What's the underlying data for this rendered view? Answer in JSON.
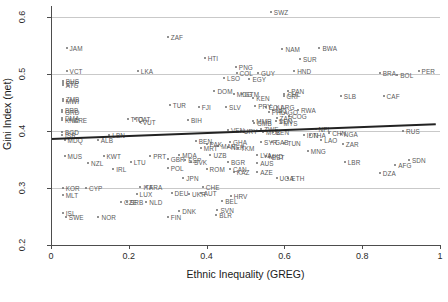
{
  "chart_data": {
    "type": "scatter",
    "title": "",
    "xlabel": "Ethnic Inequality (GREG)",
    "ylabel": "Gini Index (net)",
    "xlim": [
      0,
      1
    ],
    "ylim": [
      0.2,
      0.62
    ],
    "xticks": [
      0,
      0.2,
      0.4,
      0.6,
      0.8,
      1
    ],
    "xticklabels": [
      "0",
      "0.2",
      "0.4",
      "0.6",
      "0.8",
      "1"
    ],
    "yticks": [
      0.2,
      0.3,
      0.4,
      0.5,
      0.6
    ],
    "yticklabels": [
      "0.2",
      "0.3",
      "0.4",
      "0.5",
      "0.6"
    ],
    "grid": "horizontal",
    "legend": "none",
    "point_color": "#6e6e6e",
    "label_color": "#5a5a5a",
    "grid_color": "#c9c9c9",
    "trendline": {
      "type": "linear-fit",
      "color": "#222222",
      "x0": 0.0,
      "y0": 0.388,
      "x1": 0.99,
      "y1": 0.414
    },
    "points": [
      {
        "label": "SWZ",
        "x": 0.565,
        "y": 0.61
      },
      {
        "label": "ZAF",
        "x": 0.3,
        "y": 0.566
      },
      {
        "label": "JAM",
        "x": 0.04,
        "y": 0.547
      },
      {
        "label": "NAM",
        "x": 0.595,
        "y": 0.545
      },
      {
        "label": "BWA",
        "x": 0.69,
        "y": 0.546
      },
      {
        "label": "HTI",
        "x": 0.395,
        "y": 0.528
      },
      {
        "label": "SUR",
        "x": 0.64,
        "y": 0.527
      },
      {
        "label": "VCT",
        "x": 0.04,
        "y": 0.506
      },
      {
        "label": "LKA",
        "x": 0.223,
        "y": 0.505
      },
      {
        "label": "PNG",
        "x": 0.475,
        "y": 0.513
      },
      {
        "label": "COL",
        "x": 0.477,
        "y": 0.503
      },
      {
        "label": "GUY",
        "x": 0.532,
        "y": 0.503
      },
      {
        "label": "HND",
        "x": 0.625,
        "y": 0.505
      },
      {
        "label": "BRA",
        "x": 0.845,
        "y": 0.503
      },
      {
        "label": "PER",
        "x": 0.945,
        "y": 0.505
      },
      {
        "label": "BOL",
        "x": 0.89,
        "y": 0.499
      },
      {
        "label": "LSO",
        "x": 0.445,
        "y": 0.494
      },
      {
        "label": "EGY",
        "x": 0.51,
        "y": 0.492
      },
      {
        "label": "BHS",
        "x": 0.03,
        "y": 0.489
      },
      {
        "label": "CYP",
        "x": 0.03,
        "y": 0.485
      },
      {
        "label": "ATG",
        "x": 0.03,
        "y": 0.481
      },
      {
        "label": "DOM",
        "x": 0.42,
        "y": 0.47
      },
      {
        "label": "MDG",
        "x": 0.47,
        "y": 0.466
      },
      {
        "label": "GTM",
        "x": 0.49,
        "y": 0.466
      },
      {
        "label": "PAN",
        "x": 0.61,
        "y": 0.47
      },
      {
        "label": "CHL",
        "x": 0.6,
        "y": 0.465
      },
      {
        "label": "CRI",
        "x": 0.598,
        "y": 0.462
      },
      {
        "label": "CAF",
        "x": 0.855,
        "y": 0.462
      },
      {
        "label": "SLB",
        "x": 0.745,
        "y": 0.462
      },
      {
        "label": "KEN",
        "x": 0.52,
        "y": 0.458
      },
      {
        "label": "ZMB",
        "x": 0.03,
        "y": 0.456
      },
      {
        "label": "MWI",
        "x": 0.03,
        "y": 0.453
      },
      {
        "label": "FJI",
        "x": 0.38,
        "y": 0.443
      },
      {
        "label": "TUR",
        "x": 0.305,
        "y": 0.446
      },
      {
        "label": "SLV",
        "x": 0.45,
        "y": 0.442
      },
      {
        "label": "PRY",
        "x": 0.525,
        "y": 0.445
      },
      {
        "label": "ECU",
        "x": 0.552,
        "y": 0.443
      },
      {
        "label": "ARG",
        "x": 0.582,
        "y": 0.443
      },
      {
        "label": "NIC",
        "x": 0.57,
        "y": 0.438
      },
      {
        "label": "RWA",
        "x": 0.635,
        "y": 0.437
      },
      {
        "label": "PHL",
        "x": 0.56,
        "y": 0.434
      },
      {
        "label": "AGO",
        "x": 0.59,
        "y": 0.433
      },
      {
        "label": "BRB",
        "x": 0.028,
        "y": 0.438
      },
      {
        "label": "GRD",
        "x": 0.028,
        "y": 0.433
      },
      {
        "label": "DMA",
        "x": 0.028,
        "y": 0.424
      },
      {
        "label": "KNA",
        "x": 0.028,
        "y": 0.42
      },
      {
        "label": "CRE",
        "x": 0.05,
        "y": 0.42
      },
      {
        "label": "TTO",
        "x": 0.197,
        "y": 0.421
      },
      {
        "label": "QAT",
        "x": 0.215,
        "y": 0.421
      },
      {
        "label": "VUT",
        "x": 0.228,
        "y": 0.416
      },
      {
        "label": "BIH",
        "x": 0.352,
        "y": 0.419
      },
      {
        "label": "COG",
        "x": 0.612,
        "y": 0.427
      },
      {
        "label": "ZAR",
        "x": 0.58,
        "y": 0.423
      },
      {
        "label": "SEN",
        "x": 0.578,
        "y": 0.418
      },
      {
        "label": "GMB",
        "x": 0.522,
        "y": 0.414
      },
      {
        "label": "MMR",
        "x": 0.52,
        "y": 0.418
      },
      {
        "label": "VEN",
        "x": 0.455,
        "y": 0.402
      },
      {
        "label": "URY",
        "x": 0.488,
        "y": 0.4
      },
      {
        "label": "MYS",
        "x": 0.59,
        "y": 0.415
      },
      {
        "label": "ZWE",
        "x": 0.54,
        "y": 0.404
      },
      {
        "label": "MOZ",
        "x": 0.545,
        "y": 0.399
      },
      {
        "label": "BEN",
        "x": 0.57,
        "y": 0.398
      },
      {
        "label": "NPL",
        "x": 0.68,
        "y": 0.404
      },
      {
        "label": "NGA",
        "x": 0.745,
        "y": 0.395
      },
      {
        "label": "CHN",
        "x": 0.715,
        "y": 0.397
      },
      {
        "label": "IDN",
        "x": 0.65,
        "y": 0.393
      },
      {
        "label": "THA",
        "x": 0.665,
        "y": 0.393
      },
      {
        "label": "RUS",
        "x": 0.905,
        "y": 0.4
      },
      {
        "label": "BGD",
        "x": 0.028,
        "y": 0.398
      },
      {
        "label": "ISR",
        "x": 0.028,
        "y": 0.394
      },
      {
        "label": "MDQ",
        "x": 0.035,
        "y": 0.385
      },
      {
        "label": "LBN",
        "x": 0.15,
        "y": 0.393
      },
      {
        "label": "ALB",
        "x": 0.12,
        "y": 0.385
      },
      {
        "label": "GHA",
        "x": 0.46,
        "y": 0.381
      },
      {
        "label": "BEN2",
        "x": 0.372,
        "y": 0.383
      },
      {
        "label": "SYR",
        "x": 0.54,
        "y": 0.381
      },
      {
        "label": "GAB",
        "x": 0.568,
        "y": 0.381
      },
      {
        "label": "TUN",
        "x": 0.6,
        "y": 0.379
      },
      {
        "label": "LAO",
        "x": 0.695,
        "y": 0.384
      },
      {
        "label": "ZAR2",
        "x": 0.75,
        "y": 0.378
      },
      {
        "label": "MAR",
        "x": 0.43,
        "y": 0.374
      },
      {
        "label": "PAK",
        "x": 0.4,
        "y": 0.377
      },
      {
        "label": "MRT",
        "x": 0.385,
        "y": 0.37
      },
      {
        "label": "NER",
        "x": 0.455,
        "y": 0.372
      },
      {
        "label": "TKM",
        "x": 0.48,
        "y": 0.37
      },
      {
        "label": "MNG",
        "x": 0.66,
        "y": 0.366
      },
      {
        "label": "MDA",
        "x": 0.33,
        "y": 0.358
      },
      {
        "label": "UZB",
        "x": 0.41,
        "y": 0.358
      },
      {
        "label": "LVA",
        "x": 0.53,
        "y": 0.358
      },
      {
        "label": "EST",
        "x": 0.56,
        "y": 0.355
      },
      {
        "label": "MUS",
        "x": 0.035,
        "y": 0.356
      },
      {
        "label": "KWT",
        "x": 0.135,
        "y": 0.356
      },
      {
        "label": "PRT",
        "x": 0.255,
        "y": 0.356
      },
      {
        "label": "GBR",
        "x": 0.3,
        "y": 0.352
      },
      {
        "label": "ESP",
        "x": 0.345,
        "y": 0.35
      },
      {
        "label": "MKD",
        "x": 0.552,
        "y": 0.356
      },
      {
        "label": "SDN",
        "x": 0.92,
        "y": 0.349
      },
      {
        "label": "NZL",
        "x": 0.095,
        "y": 0.344
      },
      {
        "label": "LTU",
        "x": 0.205,
        "y": 0.345
      },
      {
        "label": "SVK",
        "x": 0.36,
        "y": 0.346
      },
      {
        "label": "BGR",
        "x": 0.455,
        "y": 0.345
      },
      {
        "label": "AUS",
        "x": 0.53,
        "y": 0.344
      },
      {
        "label": "LBR",
        "x": 0.755,
        "y": 0.345
      },
      {
        "label": "AFG",
        "x": 0.885,
        "y": 0.34
      },
      {
        "label": "IRL",
        "x": 0.16,
        "y": 0.334
      },
      {
        "label": "POL",
        "x": 0.3,
        "y": 0.335
      },
      {
        "label": "ROM",
        "x": 0.4,
        "y": 0.334
      },
      {
        "label": "CAN",
        "x": 0.46,
        "y": 0.333
      },
      {
        "label": "KAZ",
        "x": 0.47,
        "y": 0.328
      },
      {
        "label": "AZE",
        "x": 0.53,
        "y": 0.328
      },
      {
        "label": "DZA",
        "x": 0.845,
        "y": 0.327
      },
      {
        "label": "KOR",
        "x": 0.03,
        "y": 0.3
      },
      {
        "label": "CYP2",
        "x": 0.09,
        "y": 0.301
      },
      {
        "label": "JPN",
        "x": 0.34,
        "y": 0.318
      },
      {
        "label": "MLT",
        "x": 0.03,
        "y": 0.287
      },
      {
        "label": "ITA",
        "x": 0.23,
        "y": 0.302
      },
      {
        "label": "FRA",
        "x": 0.245,
        "y": 0.302
      },
      {
        "label": "CHE",
        "x": 0.39,
        "y": 0.302
      },
      {
        "label": "ETH",
        "x": 0.61,
        "y": 0.318
      },
      {
        "label": "UGA",
        "x": 0.58,
        "y": 0.318
      },
      {
        "label": "LUX",
        "x": 0.22,
        "y": 0.29
      },
      {
        "label": "DEU",
        "x": 0.31,
        "y": 0.292
      },
      {
        "label": "UKR",
        "x": 0.355,
        "y": 0.289
      },
      {
        "label": "AUT",
        "x": 0.385,
        "y": 0.291
      },
      {
        "label": "HRV",
        "x": 0.462,
        "y": 0.286
      },
      {
        "label": "CZE",
        "x": 0.18,
        "y": 0.276
      },
      {
        "label": "SRB",
        "x": 0.195,
        "y": 0.276
      },
      {
        "label": "NLD",
        "x": 0.245,
        "y": 0.276
      },
      {
        "label": "BEL",
        "x": 0.44,
        "y": 0.277
      },
      {
        "label": "ISL",
        "x": 0.03,
        "y": 0.256
      },
      {
        "label": "DNK",
        "x": 0.33,
        "y": 0.26
      },
      {
        "label": "SVN",
        "x": 0.428,
        "y": 0.262
      },
      {
        "label": "BLR",
        "x": 0.425,
        "y": 0.253
      },
      {
        "label": "SWE",
        "x": 0.038,
        "y": 0.249
      },
      {
        "label": "NOR",
        "x": 0.122,
        "y": 0.249
      },
      {
        "label": "FIN",
        "x": 0.3,
        "y": 0.25
      }
    ]
  }
}
